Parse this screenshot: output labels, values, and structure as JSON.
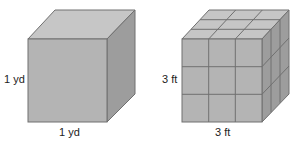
{
  "figures": [
    {
      "name": "cubic-yard",
      "height_label": "1 yd",
      "width_label": "1 yd",
      "subdivisions": 1
    },
    {
      "name": "cubic-feet",
      "height_label": "3 ft",
      "width_label": "3 ft",
      "subdivisions": 3
    }
  ],
  "colors": {
    "front": "#b3b3b3",
    "top": "#c4c4c4",
    "side": "#9a9a9a",
    "edge": "#6e6e6e"
  }
}
